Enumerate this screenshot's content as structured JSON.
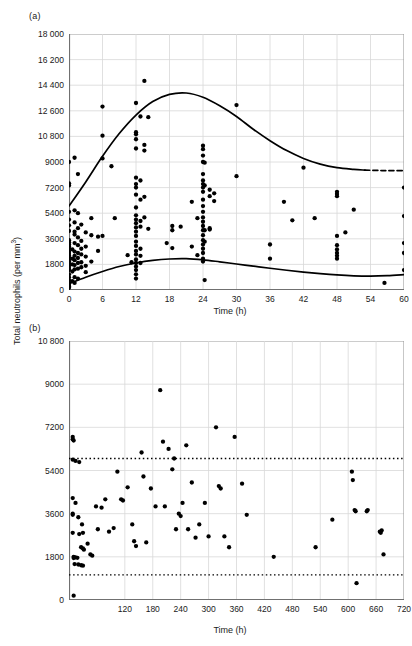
{
  "figure": {
    "ylabel": "Total neutrophils (per mm",
    "ylabel_sup": "3",
    "ylabel_close": ")",
    "panel_a_tag": "(a)",
    "panel_b_tag": "(b)",
    "grid_color": "#d8d8d8",
    "axis_color": "#808080",
    "marker_color": "#000000",
    "curve_color": "#000000"
  },
  "chart_data": [
    {
      "type": "scatter",
      "panel": "(a)",
      "title": "",
      "xlabel": "Time (h)",
      "ylabel": "Total neutrophils (per mm3)",
      "xlim": [
        0,
        60
      ],
      "ylim": [
        0,
        18000
      ],
      "xticks": [
        0,
        6,
        12,
        18,
        24,
        30,
        36,
        42,
        48,
        54,
        60
      ],
      "xticklabels": [
        "0",
        "6",
        "12",
        "18",
        "24",
        "30",
        "36",
        "42",
        "48",
        "54",
        "60"
      ],
      "yticks": [
        0,
        1800,
        3600,
        5400,
        7200,
        9000,
        10800,
        12600,
        14400,
        16200,
        18000
      ],
      "yticklabels": [
        "0",
        "1800",
        "3600",
        "5400",
        "7200",
        "9000",
        "10 800",
        "12 600",
        "14 400",
        "16 200",
        "18 000"
      ],
      "grid": true,
      "legend": "none",
      "points": [
        [
          0,
          9000
        ],
        [
          0,
          7500
        ],
        [
          0,
          7350
        ],
        [
          0,
          5500
        ],
        [
          0,
          4950
        ],
        [
          0,
          4550
        ],
        [
          0,
          4150
        ],
        [
          0,
          3500
        ],
        [
          0,
          3350
        ],
        [
          0,
          3200
        ],
        [
          0,
          3050
        ],
        [
          0,
          2900
        ],
        [
          0,
          2750
        ],
        [
          0,
          2600
        ],
        [
          0,
          2450
        ],
        [
          0,
          2300
        ],
        [
          0,
          2150
        ],
        [
          0,
          2000
        ],
        [
          0,
          1850
        ],
        [
          0,
          1700
        ],
        [
          0,
          1550
        ],
        [
          0,
          1400
        ],
        [
          0,
          1100
        ],
        [
          0,
          900
        ],
        [
          0,
          700
        ],
        [
          0,
          500
        ],
        [
          0,
          350
        ],
        [
          0,
          250
        ],
        [
          0,
          150
        ],
        [
          0.6,
          2850
        ],
        [
          0.6,
          2200
        ],
        [
          0.6,
          1800
        ],
        [
          0.6,
          1300
        ],
        [
          0.6,
          620
        ],
        [
          1.0,
          9300
        ],
        [
          1.0,
          5600
        ],
        [
          1.0,
          4750
        ],
        [
          1.0,
          4100
        ],
        [
          1.0,
          3900
        ],
        [
          1.0,
          3300
        ],
        [
          1.0,
          2700
        ],
        [
          1.0,
          2400
        ],
        [
          1.0,
          2100
        ],
        [
          1.0,
          1750
        ],
        [
          1.0,
          1450
        ],
        [
          1.0,
          900
        ],
        [
          1.0,
          500
        ],
        [
          1.6,
          8150
        ],
        [
          1.6,
          5400
        ],
        [
          1.6,
          4350
        ],
        [
          1.6,
          3700
        ],
        [
          1.6,
          3150
        ],
        [
          1.6,
          2600
        ],
        [
          1.6,
          2250
        ],
        [
          1.6,
          1900
        ],
        [
          1.6,
          1500
        ],
        [
          1.6,
          800
        ],
        [
          2.2,
          4600
        ],
        [
          2.2,
          3450
        ],
        [
          2.2,
          2900
        ],
        [
          2.2,
          2500
        ],
        [
          2.2,
          1950
        ],
        [
          2.2,
          1600
        ],
        [
          3.0,
          4050
        ],
        [
          3.0,
          3050
        ],
        [
          3.0,
          2350
        ],
        [
          3.0,
          1700
        ],
        [
          3.0,
          1250
        ],
        [
          4.0,
          5050
        ],
        [
          4.0,
          3850
        ],
        [
          4.0,
          2000
        ],
        [
          5.2,
          3750
        ],
        [
          5.2,
          2750
        ],
        [
          6.0,
          12900
        ],
        [
          6.0,
          10850
        ],
        [
          6.0,
          9250
        ],
        [
          6.0,
          3800
        ],
        [
          7.6,
          8700
        ],
        [
          8.2,
          5050
        ],
        [
          10.5,
          2450
        ],
        [
          11.2,
          1950
        ],
        [
          12.0,
          13150
        ],
        [
          12.0,
          11100
        ],
        [
          12.0,
          10950
        ],
        [
          12.0,
          10600
        ],
        [
          12.0,
          9950
        ],
        [
          12.0,
          7900
        ],
        [
          12.0,
          7450
        ],
        [
          12.0,
          7200
        ],
        [
          12.0,
          6700
        ],
        [
          12.0,
          5800
        ],
        [
          12.0,
          5250
        ],
        [
          12.0,
          4950
        ],
        [
          12.0,
          4700
        ],
        [
          12.0,
          4400
        ],
        [
          12.0,
          4100
        ],
        [
          12.0,
          3800
        ],
        [
          12.0,
          3400
        ],
        [
          12.0,
          3100
        ],
        [
          12.0,
          2750
        ],
        [
          12.0,
          2500
        ],
        [
          12.0,
          2150
        ],
        [
          12.0,
          1900
        ],
        [
          12.0,
          1650
        ],
        [
          12.0,
          1400
        ],
        [
          12.0,
          1100
        ],
        [
          12.0,
          800
        ],
        [
          12.8,
          12200
        ],
        [
          12.8,
          7700
        ],
        [
          12.8,
          6350
        ],
        [
          12.8,
          4850
        ],
        [
          12.8,
          4450
        ],
        [
          12.8,
          2900
        ],
        [
          12.8,
          2400
        ],
        [
          12.8,
          1900
        ],
        [
          13.5,
          14700
        ],
        [
          13.5,
          10200
        ],
        [
          13.5,
          9800
        ],
        [
          13.5,
          6550
        ],
        [
          13.5,
          5100
        ],
        [
          14.2,
          12150
        ],
        [
          14.2,
          4300
        ],
        [
          17.5,
          3300
        ],
        [
          18.5,
          4500
        ],
        [
          18.5,
          4200
        ],
        [
          18.5,
          2950
        ],
        [
          20.0,
          4450
        ],
        [
          22.0,
          6200
        ],
        [
          22.0,
          3050
        ],
        [
          23.0,
          5050
        ],
        [
          23.0,
          2450
        ],
        [
          24.0,
          10150
        ],
        [
          24.0,
          9900
        ],
        [
          24.0,
          9450
        ],
        [
          24.0,
          9000
        ],
        [
          24.0,
          8150
        ],
        [
          24.0,
          7700
        ],
        [
          24.0,
          7450
        ],
        [
          24.0,
          7200
        ],
        [
          24.0,
          6900
        ],
        [
          24.0,
          6350
        ],
        [
          24.0,
          5900
        ],
        [
          24.0,
          5500
        ],
        [
          24.0,
          5100
        ],
        [
          24.0,
          4800
        ],
        [
          24.0,
          4500
        ],
        [
          24.0,
          4200
        ],
        [
          24.0,
          3850
        ],
        [
          24.0,
          3500
        ],
        [
          24.0,
          3200
        ],
        [
          24.0,
          2900
        ],
        [
          24.0,
          2600
        ],
        [
          24.0,
          2200
        ],
        [
          24.0,
          2000
        ],
        [
          24.3,
          8950
        ],
        [
          24.3,
          7350
        ],
        [
          24.3,
          4200
        ],
        [
          24.3,
          3400
        ],
        [
          24.3,
          700
        ],
        [
          25.2,
          7050
        ],
        [
          25.2,
          6600
        ],
        [
          25.2,
          4350
        ],
        [
          25.2,
          4250
        ],
        [
          26.0,
          6800
        ],
        [
          26.0,
          6250
        ],
        [
          30.0,
          13000
        ],
        [
          30.0,
          8000
        ],
        [
          36.0,
          3200
        ],
        [
          36.0,
          2200
        ],
        [
          38.5,
          6200
        ],
        [
          40.0,
          4900
        ],
        [
          42.0,
          8600
        ],
        [
          44.0,
          5050
        ],
        [
          48.0,
          6900
        ],
        [
          48.0,
          6750
        ],
        [
          48.0,
          6600
        ],
        [
          48.0,
          3800
        ],
        [
          48.0,
          3150
        ],
        [
          48.0,
          2850
        ],
        [
          48.0,
          2600
        ],
        [
          48.0,
          2400
        ],
        [
          48.0,
          2200
        ],
        [
          49.5,
          4050
        ],
        [
          51.0,
          5650
        ],
        [
          56.5,
          500
        ],
        [
          60.0,
          7200
        ],
        [
          60.0,
          5200
        ],
        [
          60.0,
          3300
        ],
        [
          60.0,
          2600
        ],
        [
          60.0,
          1400
        ]
      ],
      "curves": [
        {
          "name": "upper-reference-curve",
          "style": "solid",
          "points": [
            [
              0,
              5900
            ],
            [
              3,
              7600
            ],
            [
              6,
              9400
            ],
            [
              9,
              11000
            ],
            [
              12,
              12300
            ],
            [
              15,
              13250
            ],
            [
              18,
              13750
            ],
            [
              21,
              13850
            ],
            [
              24,
              13550
            ],
            [
              27,
              12950
            ],
            [
              30,
              12200
            ],
            [
              33,
              11300
            ],
            [
              36,
              10500
            ],
            [
              39,
              9800
            ],
            [
              42,
              9250
            ],
            [
              45,
              8850
            ],
            [
              48,
              8600
            ],
            [
              51,
              8480
            ],
            [
              53,
              8430
            ]
          ]
        },
        {
          "name": "upper-reference-curve-dashed-tail",
          "style": "dashed",
          "points": [
            [
              53,
              8430
            ],
            [
              56,
              8400
            ],
            [
              60,
              8400
            ]
          ]
        },
        {
          "name": "lower-reference-curve",
          "style": "solid",
          "points": [
            [
              0,
              450
            ],
            [
              3,
              900
            ],
            [
              6,
              1300
            ],
            [
              9,
              1650
            ],
            [
              12,
              1900
            ],
            [
              15,
              2080
            ],
            [
              18,
              2180
            ],
            [
              21,
              2200
            ],
            [
              24,
              2120
            ],
            [
              27,
              1980
            ],
            [
              30,
              1830
            ],
            [
              33,
              1680
            ],
            [
              36,
              1530
            ],
            [
              39,
              1390
            ],
            [
              42,
              1260
            ],
            [
              45,
              1150
            ],
            [
              48,
              1060
            ],
            [
              51,
              1000
            ],
            [
              54,
              980
            ],
            [
              57,
              1010
            ],
            [
              60,
              1080
            ]
          ]
        }
      ]
    },
    {
      "type": "scatter",
      "panel": "(b)",
      "title": "",
      "xlabel": "Time (h)",
      "ylabel": "Total neutrophils (per mm3)",
      "xlim": [
        0,
        720
      ],
      "ylim": [
        0,
        10800
      ],
      "xticks": [
        120,
        180,
        240,
        300,
        360,
        420,
        480,
        540,
        600,
        660,
        720
      ],
      "xticklabels": [
        "120",
        "180",
        "240",
        "300",
        "360",
        "420",
        "480",
        "540",
        "600",
        "660",
        "720"
      ],
      "yticks": [
        0,
        1800,
        3600,
        5400,
        7200,
        9000,
        10800
      ],
      "yticklabels": [
        "0",
        "1800",
        "3600",
        "5400",
        "7200",
        "9000",
        "10 800"
      ],
      "grid": true,
      "legend": "none",
      "reference_lines": [
        {
          "name": "upper-limit-line",
          "y": 5900,
          "style": "dotted"
        },
        {
          "name": "lower-limit-line",
          "y": 1050,
          "style": "dotted"
        }
      ],
      "points": [
        [
          8,
          6800
        ],
        [
          8,
          6700
        ],
        [
          10,
          6650
        ],
        [
          8,
          5850
        ],
        [
          14,
          5800
        ],
        [
          22,
          5750
        ],
        [
          8,
          4250
        ],
        [
          14,
          4050
        ],
        [
          8,
          3600
        ],
        [
          8,
          3550
        ],
        [
          20,
          3450
        ],
        [
          28,
          3150
        ],
        [
          8,
          2800
        ],
        [
          22,
          2750
        ],
        [
          30,
          2800
        ],
        [
          10,
          1800
        ],
        [
          10,
          1750
        ],
        [
          14,
          1780
        ],
        [
          18,
          1760
        ],
        [
          26,
          2200
        ],
        [
          30,
          2150
        ],
        [
          32,
          2100
        ],
        [
          12,
          1500
        ],
        [
          20,
          1480
        ],
        [
          26,
          1450
        ],
        [
          30,
          1430
        ],
        [
          10,
          180
        ],
        [
          40,
          2350
        ],
        [
          46,
          1900
        ],
        [
          50,
          1850
        ],
        [
          58,
          3900
        ],
        [
          62,
          2950
        ],
        [
          70,
          3850
        ],
        [
          78,
          4200
        ],
        [
          86,
          2850
        ],
        [
          96,
          3000
        ],
        [
          104,
          5350
        ],
        [
          112,
          4200
        ],
        [
          116,
          4150
        ],
        [
          126,
          4700
        ],
        [
          136,
          3150
        ],
        [
          140,
          2450
        ],
        [
          144,
          2250
        ],
        [
          156,
          6150
        ],
        [
          160,
          5150
        ],
        [
          166,
          2400
        ],
        [
          176,
          4650
        ],
        [
          186,
          3900
        ],
        [
          196,
          8750
        ],
        [
          202,
          6600
        ],
        [
          206,
          3900
        ],
        [
          214,
          6300
        ],
        [
          222,
          5450
        ],
        [
          226,
          5900
        ],
        [
          230,
          2950
        ],
        [
          236,
          3600
        ],
        [
          240,
          3500
        ],
        [
          244,
          4050
        ],
        [
          252,
          6450
        ],
        [
          256,
          2950
        ],
        [
          264,
          4900
        ],
        [
          272,
          2600
        ],
        [
          280,
          3150
        ],
        [
          292,
          4050
        ],
        [
          300,
          2650
        ],
        [
          316,
          7200
        ],
        [
          322,
          4750
        ],
        [
          326,
          4650
        ],
        [
          334,
          2650
        ],
        [
          344,
          2200
        ],
        [
          356,
          6800
        ],
        [
          372,
          4850
        ],
        [
          382,
          3550
        ],
        [
          440,
          1800
        ],
        [
          530,
          2200
        ],
        [
          566,
          3350
        ],
        [
          608,
          5350
        ],
        [
          610,
          5000
        ],
        [
          614,
          3750
        ],
        [
          616,
          3700
        ],
        [
          618,
          700
        ],
        [
          640,
          3700
        ],
        [
          642,
          3750
        ],
        [
          668,
          2850
        ],
        [
          670,
          2800
        ],
        [
          672,
          2900
        ],
        [
          676,
          1900
        ]
      ]
    }
  ]
}
